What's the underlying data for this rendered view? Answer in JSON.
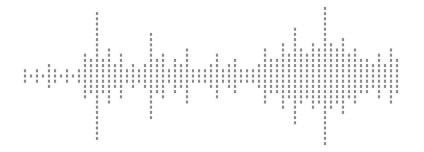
{
  "canvas": {
    "width": 424,
    "height": 152,
    "background": "#ffffff"
  },
  "waveform": {
    "title": "Audio waveform",
    "style": "dotted-vertical-bars",
    "bar_color": "#8a8a8a",
    "bar_width": 2.2,
    "bar_spacing": 6.0,
    "dash_length": 3.0,
    "dash_gap": 2.2,
    "baseline_y": 76,
    "x_start": 25,
    "x_end": 400,
    "max_amplitude": 64,
    "amplitude_unit": "px_half_height",
    "bar_count": 63,
    "amplitudes": [
      6,
      4,
      10,
      3,
      12,
      7,
      5,
      9,
      4,
      8,
      22,
      16,
      64,
      18,
      26,
      14,
      22,
      9,
      12,
      7,
      14,
      44,
      17,
      24,
      10,
      20,
      12,
      26,
      8,
      10,
      6,
      14,
      24,
      9,
      12,
      16,
      10,
      6,
      8,
      12,
      28,
      20,
      18,
      34,
      22,
      48,
      30,
      24,
      36,
      28,
      68,
      34,
      30,
      40,
      22,
      26,
      16,
      20,
      12,
      22,
      14,
      26,
      16,
      10,
      20,
      14,
      8,
      18,
      10,
      6,
      12,
      24,
      8,
      14,
      6,
      10,
      4,
      8
    ]
  }
}
